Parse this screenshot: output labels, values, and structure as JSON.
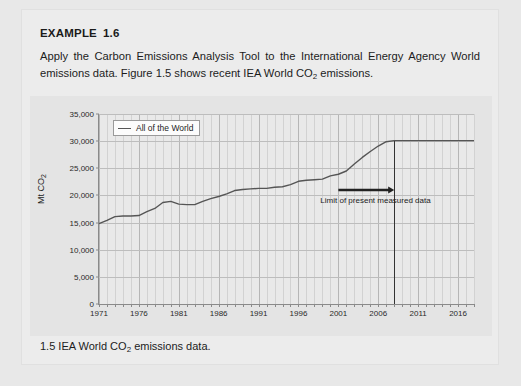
{
  "example": {
    "heading_label": "EXAMPLE",
    "heading_number": "1.6",
    "body_part1": "Apply the Carbon Emissions Analysis Tool to the International Energy Agency World emissions data. Figure 1.5 shows recent IEA World CO",
    "body_sub": "2",
    "body_part2": " emissions."
  },
  "caption": {
    "number": "1.5",
    "text_part1": "IEA World CO",
    "text_sub": "2",
    "text_part2": " emissions data."
  },
  "chart_data": {
    "type": "line",
    "title": "",
    "xlabel": "",
    "ylabel": "Mt CO2",
    "ylabel_prefix": "Mt CO",
    "ylabel_sub": "2",
    "xlim": [
      1971,
      2018
    ],
    "ylim": [
      0,
      35000
    ],
    "ytick_labels": [
      "0",
      "5,000",
      "10,000",
      "15,000",
      "20,000",
      "25,000",
      "30,000",
      "35,000"
    ],
    "ytick_values": [
      0,
      5000,
      10000,
      15000,
      20000,
      25000,
      30000,
      35000
    ],
    "xtick_labels": [
      "1971",
      "1976",
      "1981",
      "1986",
      "1991",
      "1996",
      "2001",
      "2006",
      "2011",
      "2016"
    ],
    "xtick_values": [
      1971,
      1976,
      1981,
      1986,
      1991,
      1996,
      2001,
      2006,
      2011,
      2016
    ],
    "grid": true,
    "minor_x_grid_step": 1,
    "legend_position": "top-left",
    "legend": [
      "All of the World"
    ],
    "series": [
      {
        "name": "All of the World",
        "color": "#555555",
        "x": [
          1971,
          1972,
          1973,
          1974,
          1975,
          1976,
          1977,
          1978,
          1979,
          1980,
          1981,
          1982,
          1983,
          1984,
          1985,
          1986,
          1987,
          1988,
          1989,
          1990,
          1991,
          1992,
          1993,
          1994,
          1995,
          1996,
          1997,
          1998,
          1999,
          2000,
          2001,
          2002,
          2003,
          2004,
          2005,
          2006,
          2007,
          2008,
          2009,
          2010,
          2011,
          2012,
          2013,
          2014,
          2015,
          2016,
          2017,
          2018
        ],
        "values": [
          14800,
          15400,
          16100,
          16200,
          16200,
          16300,
          17000,
          17600,
          18700,
          18900,
          18400,
          18300,
          18300,
          18900,
          19400,
          19800,
          20300,
          20900,
          21100,
          21200,
          21300,
          21300,
          21500,
          21600,
          22000,
          22600,
          22800,
          22900,
          23000,
          23600,
          23900,
          24500,
          25800,
          27000,
          28100,
          29100,
          29900,
          30100,
          30100,
          30100,
          30100,
          30100,
          30100,
          30100,
          30100,
          30100,
          30100,
          30100
        ]
      }
    ],
    "annotations": [
      {
        "name": "limit-of-measured-data",
        "text": "Limit of present measured data",
        "vline_year": 2008,
        "arrow_from_year": 2001,
        "arrow_to_year": 2008,
        "arrow_value": 21000
      }
    ]
  }
}
